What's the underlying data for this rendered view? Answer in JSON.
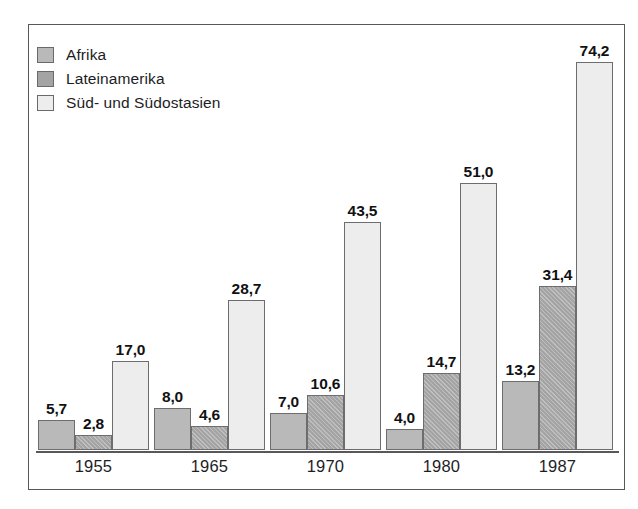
{
  "chart_data": {
    "type": "bar",
    "title": "",
    "subtitle": "",
    "xlabel": "",
    "ylabel": "",
    "ylim": [
      0,
      74.2
    ],
    "grid": false,
    "legend_position": "top-left",
    "categories": [
      "1955",
      "1965",
      "1970",
      "1980",
      "1987"
    ],
    "series": [
      {
        "name": "Afrika",
        "color": "#b9b9b9",
        "values": [
          5.7,
          8.0,
          7.0,
          4.0,
          13.2
        ],
        "labels": [
          "5,7",
          "8,0",
          "7,0",
          "4,0",
          "13,2"
        ]
      },
      {
        "name": "Lateinamerika",
        "color": "#a4a4a4",
        "values": [
          2.8,
          4.6,
          10.6,
          14.7,
          31.4
        ],
        "labels": [
          "2,8",
          "4,6",
          "10,6",
          "14,7",
          "31,4"
        ]
      },
      {
        "name": "Süd- und Südostasien",
        "color": "#ededed",
        "values": [
          17.0,
          28.7,
          43.5,
          51.0,
          74.2
        ],
        "labels": [
          "17,0",
          "28,7",
          "43,5",
          "51,0",
          "74,2"
        ]
      }
    ]
  },
  "legend": {
    "items": [
      {
        "label": "Afrika",
        "swatch": "legend-swatch-afrika"
      },
      {
        "label": "Lateinamerika",
        "swatch": "legend-swatch-lateinamerika"
      },
      {
        "label": "Süd- und Südostasien",
        "swatch": "legend-swatch-sued-und-suedostasien"
      }
    ]
  },
  "axis": {
    "categories": [
      "1955",
      "1965",
      "1970",
      "1980",
      "1987"
    ]
  },
  "colors": {
    "afrika": "#b9b9b9",
    "lateinamerika": "#a4a4a4",
    "suedostasien": "#ededed",
    "frame": "#58585a",
    "bar_outline": "#6d6d6f",
    "text": "#1d1d1f",
    "background": "#ffffff"
  }
}
